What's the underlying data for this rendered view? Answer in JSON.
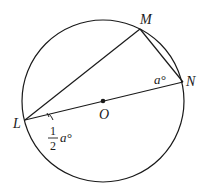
{
  "diagram": {
    "type": "circle-geometry",
    "points": {
      "L": {
        "label": "L"
      },
      "M": {
        "label": "M"
      },
      "N": {
        "label": "N"
      },
      "O": {
        "label": "O"
      }
    },
    "segments": [
      "LM",
      "MN",
      "LN"
    ],
    "center": "O",
    "angle_labels": {
      "N": {
        "text": "a°"
      },
      "L": {
        "numerator": "1",
        "denominator": "2",
        "text": "a°"
      }
    },
    "colors": {
      "stroke": "#1a1a1a",
      "background": "#ffffff"
    }
  }
}
